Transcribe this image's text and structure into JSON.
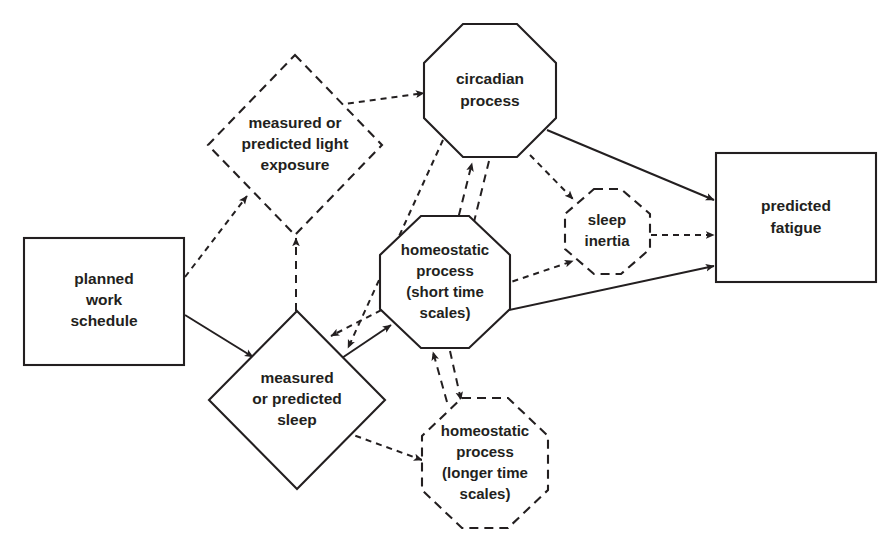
{
  "diagram": {
    "background_color": "#ffffff",
    "line_color": "#231f20",
    "nodes": [
      {
        "id": "planned_work_schedule",
        "label": "planned\nwork\nschedule",
        "lines": [
          "planned",
          "work",
          "schedule"
        ],
        "shape": "rectangle",
        "border": "solid",
        "cx": 104,
        "cy": 301
      },
      {
        "id": "light_exposure",
        "label": "measured or\npredicted light\nexposure",
        "lines": [
          "measured or",
          "predicted light",
          "exposure"
        ],
        "shape": "diamond",
        "border": "dashed",
        "cx": 295,
        "cy": 145
      },
      {
        "id": "circadian_process",
        "label": "circadian\nprocess",
        "lines": [
          "circadian",
          "process"
        ],
        "shape": "octagon",
        "border": "solid",
        "cx": 490,
        "cy": 91
      },
      {
        "id": "predicted_fatigue",
        "label": "predicted\nfatigue",
        "lines": [
          "predicted",
          "fatigue"
        ],
        "shape": "rectangle",
        "border": "solid",
        "cx": 796,
        "cy": 218
      },
      {
        "id": "sleep_inertia",
        "label": "sleep\ninertia",
        "lines": [
          "sleep",
          "inertia"
        ],
        "shape": "octagon",
        "border": "dashed",
        "cx": 607,
        "cy": 231
      },
      {
        "id": "homeostatic_short",
        "label": "homeostatic\nprocess\n(short time\nscales)",
        "lines": [
          "homeostatic",
          "process",
          "(short time",
          "scales)"
        ],
        "shape": "octagon",
        "border": "solid",
        "cx": 445,
        "cy": 282
      },
      {
        "id": "measured_sleep",
        "label": "measured\nor predicted\nsleep",
        "lines": [
          "measured",
          "or predicted",
          "sleep"
        ],
        "shape": "diamond",
        "border": "solid",
        "cx": 297,
        "cy": 400
      },
      {
        "id": "homeostatic_long",
        "label": "homeostatic\nprocess\n(longer time\nscales)",
        "lines": [
          "homeostatic",
          "process",
          "(longer time",
          "scales)"
        ],
        "shape": "octagon",
        "border": "dashed",
        "cx": 485,
        "cy": 463
      }
    ],
    "edges": [
      {
        "id": "e1",
        "from": "planned_work_schedule",
        "to": "light_exposure",
        "style": "dotted",
        "arrow": "forward"
      },
      {
        "id": "e2",
        "from": "planned_work_schedule",
        "to": "measured_sleep",
        "style": "solid",
        "arrow": "forward"
      },
      {
        "id": "e3",
        "from": "light_exposure",
        "to": "circadian_process",
        "style": "dotted",
        "arrow": "forward"
      },
      {
        "id": "e4",
        "from": "measured_sleep",
        "to": "light_exposure",
        "style": "dashed",
        "arrow": "forward"
      },
      {
        "id": "e5",
        "from": "circadian_process",
        "to": "measured_sleep",
        "style": "dotted",
        "arrow": "forward"
      },
      {
        "id": "e6",
        "from": "homeostatic_short",
        "to": "circadian_process",
        "style": "dashed",
        "arrow": "forward"
      },
      {
        "id": "e7",
        "from": "circadian_process",
        "to": "homeostatic_short",
        "style": "dashed",
        "arrow": "forward"
      },
      {
        "id": "e8",
        "from": "circadian_process",
        "to": "sleep_inertia",
        "style": "dotted",
        "arrow": "forward"
      },
      {
        "id": "e9",
        "from": "circadian_process",
        "to": "predicted_fatigue",
        "style": "solid",
        "arrow": "forward"
      },
      {
        "id": "e10",
        "from": "sleep_inertia",
        "to": "predicted_fatigue",
        "style": "dotted",
        "arrow": "forward"
      },
      {
        "id": "e11",
        "from": "homeostatic_short",
        "to": "predicted_fatigue",
        "style": "solid",
        "arrow": "forward"
      },
      {
        "id": "e12",
        "from": "homeostatic_short",
        "to": "sleep_inertia",
        "style": "dotted",
        "arrow": "forward"
      },
      {
        "id": "e13",
        "from": "measured_sleep",
        "to": "homeostatic_short",
        "style": "solid",
        "arrow": "forward"
      },
      {
        "id": "e14",
        "from": "homeostatic_short",
        "to": "measured_sleep",
        "style": "dotted",
        "arrow": "forward"
      },
      {
        "id": "e15",
        "from": "measured_sleep",
        "to": "homeostatic_long",
        "style": "dotted",
        "arrow": "forward"
      },
      {
        "id": "e16",
        "from": "homeostatic_short",
        "to": "homeostatic_long",
        "style": "dashed",
        "arrow": "forward"
      },
      {
        "id": "e17",
        "from": "homeostatic_long",
        "to": "homeostatic_short",
        "style": "dashed",
        "arrow": "forward"
      }
    ]
  }
}
